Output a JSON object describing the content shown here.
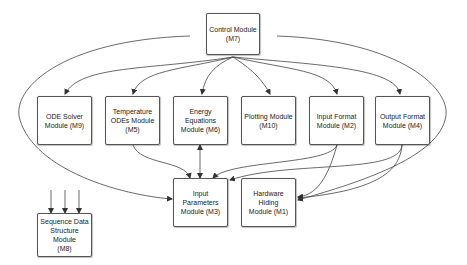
{
  "diagram": {
    "nodes": [
      {
        "id": "M7",
        "label": "Control Module\n(M7)"
      },
      {
        "id": "M9",
        "label": "ODE Solver\nModule (M9)"
      },
      {
        "id": "M5",
        "label": "Temperature\nODEs Module\n(M5)"
      },
      {
        "id": "M6",
        "label": "Energy Equations\nModule (M6)"
      },
      {
        "id": "M10",
        "label": "Plotting Module\n(M10)"
      },
      {
        "id": "M2",
        "label": "Input Format\nModule (M2)"
      },
      {
        "id": "M4",
        "label": "Output Format\nModule (M4)"
      },
      {
        "id": "M3",
        "label": "Input Parameters\nModule (M3)"
      },
      {
        "id": "M1",
        "label": "Hardware Hiding\nModule (M1)"
      },
      {
        "id": "M8",
        "label": "Sequence Data\nStructure Module\n(M8)"
      }
    ],
    "edges": [
      {
        "from": "M7",
        "to": "M9"
      },
      {
        "from": "M7",
        "to": "M5"
      },
      {
        "from": "M7",
        "to": "M6"
      },
      {
        "from": "M7",
        "to": "M10"
      },
      {
        "from": "M7",
        "to": "M2"
      },
      {
        "from": "M7",
        "to": "M4"
      },
      {
        "from": "M7",
        "to": "M3"
      },
      {
        "from": "M7",
        "to": "M1"
      },
      {
        "from": "M5",
        "to": "M3"
      },
      {
        "from": "M6",
        "to": "M3",
        "bidirectional": true
      },
      {
        "from": "M2",
        "to": "M3"
      },
      {
        "from": "M2",
        "to": "M1"
      },
      {
        "from": "M4",
        "to": "M3"
      },
      {
        "from": "M4",
        "to": "M1"
      },
      {
        "from": "?",
        "to": "M8",
        "count": 3
      }
    ]
  }
}
